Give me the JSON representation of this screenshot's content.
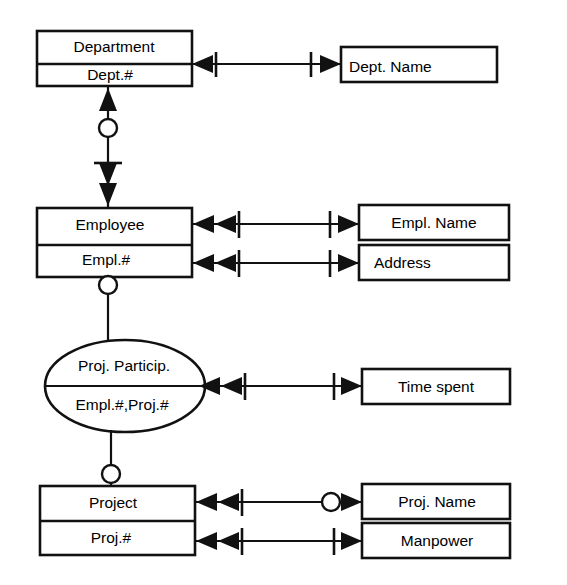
{
  "diagram": {
    "background_color": "#ffffff",
    "line_color": "#111111",
    "entities": [
      {
        "id": "department",
        "name_label": "Department",
        "key_label": "Dept.#"
      },
      {
        "id": "employee",
        "name_label": "Employee",
        "key_label": "Empl.#"
      },
      {
        "id": "project",
        "name_label": "Project",
        "key_label": "Proj.#"
      }
    ],
    "relationships": [
      {
        "id": "proj-particip",
        "name_label": "Proj. Particip.",
        "key_label": "Empl.#,Proj.#"
      }
    ],
    "attributes": [
      {
        "id": "dept-name",
        "label": "Dept. Name",
        "owner": "department"
      },
      {
        "id": "empl-name",
        "label": "Empl. Name",
        "owner": "employee"
      },
      {
        "id": "address",
        "label": "Address",
        "owner": "employee"
      },
      {
        "id": "time-spent",
        "label": "Time spent",
        "owner": "proj-particip"
      },
      {
        "id": "proj-name",
        "label": "Proj. Name",
        "owner": "project"
      },
      {
        "id": "manpower",
        "label": "Manpower",
        "owner": "project"
      }
    ],
    "connections": [
      {
        "id": "department-dept-name",
        "from": "department",
        "to": "dept-name",
        "from_cardinality": "one",
        "to_cardinality": "one",
        "from_marker": "single-arrow-tick",
        "to_marker": "tick-arrow"
      },
      {
        "id": "department-employee",
        "from": "department",
        "to": "employee",
        "from_cardinality": "zero-or-one",
        "to_cardinality": "one",
        "from_marker": "arrow-circle",
        "to_marker": "tick-arrow"
      },
      {
        "id": "employee-empl-name",
        "from": "employee",
        "to": "empl-name",
        "from_cardinality": "many",
        "to_cardinality": "one",
        "from_marker": "double-arrow-tick",
        "to_marker": "tick-arrow"
      },
      {
        "id": "employee-address",
        "from": "employee",
        "to": "address",
        "from_cardinality": "many",
        "to_cardinality": "one",
        "from_marker": "double-arrow-tick",
        "to_marker": "tick-arrow"
      },
      {
        "id": "employee-proj-particip",
        "from": "employee",
        "to": "proj-particip",
        "from_cardinality": "zero-or-one",
        "to_cardinality": "plain",
        "from_marker": "circle",
        "to_marker": "plain"
      },
      {
        "id": "proj-particip-time-spent",
        "from": "proj-particip",
        "to": "time-spent",
        "from_cardinality": "many",
        "to_cardinality": "one",
        "from_marker": "double-arrow-tick",
        "to_marker": "tick-arrow"
      },
      {
        "id": "proj-particip-project",
        "from": "proj-particip",
        "to": "project",
        "from_cardinality": "zero-or-one",
        "to_cardinality": "plain",
        "from_marker": "circle",
        "to_marker": "plain"
      },
      {
        "id": "project-proj-name",
        "from": "project",
        "to": "proj-name",
        "from_cardinality": "many",
        "to_cardinality": "zero-or-one",
        "from_marker": "double-arrow-tick",
        "to_marker": "circle-arrow"
      },
      {
        "id": "project-manpower",
        "from": "project",
        "to": "manpower",
        "from_cardinality": "many",
        "to_cardinality": "one",
        "from_marker": "double-arrow-tick",
        "to_marker": "tick-arrow"
      }
    ]
  }
}
